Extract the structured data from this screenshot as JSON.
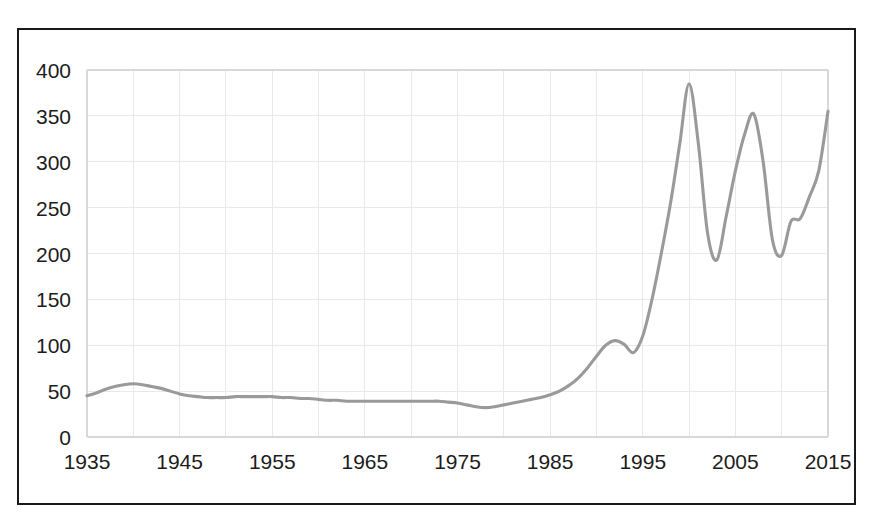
{
  "chart_data": {
    "type": "line",
    "title": "",
    "subtitle": "",
    "xlabel": "",
    "ylabel": "",
    "xlim": [
      1935,
      2015
    ],
    "ylim": [
      0,
      400
    ],
    "grid": true,
    "legend": false,
    "legend_position": "none",
    "line_color": "#9a9a9a",
    "background_color": "#ffffff",
    "border_color": "#1a1a1a",
    "gridline_color": "#e9e9e9",
    "y_ticks": [
      0,
      50,
      100,
      150,
      200,
      250,
      300,
      350,
      400
    ],
    "y_tick_labels": [
      "0",
      "50",
      "100",
      "150",
      "200",
      "250",
      "300",
      "350",
      "400"
    ],
    "x_ticks": [
      1935,
      1945,
      1955,
      1965,
      1975,
      1985,
      1995,
      2005,
      2015
    ],
    "x_tick_labels": [
      "1935",
      "1945",
      "1955",
      "1965",
      "1975",
      "1985",
      "1995",
      "2005",
      "2015"
    ],
    "x_minor_gridlines": [
      1940,
      1950,
      1960,
      1970,
      1980,
      1990,
      2000,
      2010
    ],
    "series": [
      {
        "name": "series-1",
        "x": [
          1935,
          1936,
          1937,
          1938,
          1939,
          1940,
          1941,
          1942,
          1943,
          1944,
          1945,
          1946,
          1947,
          1948,
          1949,
          1950,
          1951,
          1952,
          1953,
          1954,
          1955,
          1956,
          1957,
          1958,
          1959,
          1960,
          1961,
          1962,
          1963,
          1964,
          1965,
          1966,
          1967,
          1968,
          1969,
          1970,
          1971,
          1972,
          1973,
          1974,
          1975,
          1976,
          1977,
          1978,
          1979,
          1980,
          1981,
          1982,
          1983,
          1984,
          1985,
          1986,
          1987,
          1988,
          1989,
          1990,
          1991,
          1992,
          1993,
          1994,
          1995,
          1996,
          1997,
          1998,
          1999,
          2000,
          2001,
          2002,
          2003,
          2004,
          2005,
          2006,
          2007,
          2008,
          2009,
          2010,
          2011,
          2012,
          2013,
          2014,
          2015
        ],
        "values": [
          45,
          48,
          52,
          55,
          57,
          58,
          57,
          55,
          53,
          50,
          47,
          45,
          44,
          43,
          43,
          43,
          44,
          44,
          44,
          44,
          44,
          43,
          43,
          42,
          42,
          41,
          40,
          40,
          39,
          39,
          39,
          39,
          39,
          39,
          39,
          39,
          39,
          39,
          39,
          38,
          37,
          35,
          33,
          32,
          33,
          35,
          37,
          39,
          41,
          43,
          46,
          50,
          56,
          64,
          75,
          88,
          100,
          105,
          101,
          92,
          110,
          150,
          200,
          255,
          320,
          385,
          320,
          222,
          193,
          240,
          290,
          330,
          352,
          300,
          215,
          198,
          235,
          238,
          262,
          290,
          355
        ],
        "color": "#9a9a9a"
      }
    ],
    "annotations": [],
    "key_points": {
      "start_1935": 45,
      "early_peak_1940": 58,
      "trough_1978": 32,
      "local_peak_1992": 105,
      "local_dip_1994": 92,
      "max_peak_2000": 385,
      "trough_2003": 193,
      "peak_2007": 352,
      "trough_2009": 198,
      "plateau_2011_2012": 238,
      "peak_2014": 355,
      "end_2015": 305
    }
  }
}
